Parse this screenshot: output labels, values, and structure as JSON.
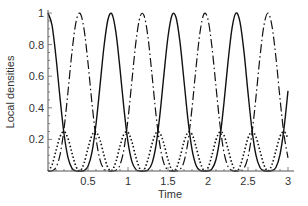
{
  "chart_data": {
    "type": "line",
    "title": "",
    "xlabel": "Time",
    "ylabel": "Local densities",
    "xlim": [
      0,
      3.05
    ],
    "ylim": [
      0,
      1
    ],
    "grid": false,
    "legend": null,
    "x_ticks": [
      0.5,
      1,
      1.5,
      2,
      2.5,
      3
    ],
    "x_tick_labels": [
      "0.5",
      "1",
      "1.5",
      "2",
      "2.5",
      "3"
    ],
    "y_ticks": [
      0.2,
      0.4,
      0.6,
      0.8,
      1
    ],
    "y_tick_labels": [
      "0.2",
      "0.4",
      "0.6",
      "0.8",
      "1"
    ],
    "x": [
      0,
      0.05,
      0.1,
      0.15,
      0.2,
      0.25,
      0.3,
      0.35,
      0.4,
      0.45,
      0.5,
      0.55,
      0.6,
      0.65,
      0.7,
      0.75,
      0.8,
      0.85,
      0.9,
      0.95,
      1.0,
      1.05,
      1.1,
      1.15,
      1.2,
      1.25,
      1.3,
      1.35,
      1.4,
      1.45,
      1.5,
      1.55,
      1.6,
      1.65,
      1.7,
      1.75,
      1.8,
      1.85,
      1.9,
      1.95,
      2.0,
      2.05,
      2.1,
      2.15,
      2.2,
      2.25,
      2.3,
      2.35,
      2.4,
      2.45,
      2.5,
      2.55,
      2.6,
      2.65,
      2.7,
      2.75,
      2.8,
      2.85,
      2.9,
      2.95,
      3.0
    ],
    "series": [
      {
        "name": "solid",
        "style": "solid",
        "values": [
          1.0,
          0.9226,
          0.7198,
          0.464,
          0.2356,
          0.0852,
          0.0172,
          0.0008,
          0.0,
          0.0027,
          0.03,
          0.1199,
          0.2957,
          0.5392,
          0.788,
          0.9606,
          0.9932,
          0.8737,
          0.6467,
          0.3915,
          0.1825,
          0.0578,
          0.0089,
          0.0002,
          0.0001,
          0.0065,
          0.0482,
          0.1623,
          0.3619,
          0.6148,
          0.8499,
          0.9861,
          0.9732,
          0.8152,
          0.5712,
          0.3231,
          0.137,
          0.037,
          0.004,
          0.0,
          0.0004,
          0.0132,
          0.0727,
          0.2122,
          0.4328,
          0.6891,
          0.9029,
          0.9996,
          0.9424,
          0.7536,
          0.4958,
          0.2603,
          0.0989,
          0.0222,
          0.0015,
          0.0,
          0.0018,
          0.024,
          0.1043,
          0.2698,
          0.5071
        ]
      },
      {
        "name": "dash-dot",
        "style": "dashdot",
        "values": [
          0.0,
          0.0016,
          0.023,
          0.1016,
          0.2648,
          0.5014,
          0.7546,
          0.943,
          0.9983,
          0.8995,
          0.6836,
          0.4273,
          0.2081,
          0.0706,
          0.0126,
          0.0004,
          0.0,
          0.0043,
          0.0383,
          0.1401,
          0.3281,
          0.577,
          0.8201,
          0.975,
          0.9847,
          0.8455,
          0.6092,
          0.3565,
          0.1587,
          0.0466,
          0.0061,
          0.0,
          0.0002,
          0.0094,
          0.0596,
          0.1863,
          0.3966,
          0.6524,
          0.8776,
          0.9942,
          0.9581,
          0.7831,
          0.5333,
          0.291,
          0.117,
          0.0289,
          0.0025,
          0.0,
          0.0009,
          0.0174,
          0.0876,
          0.2399,
          0.4699,
          0.7242,
          0.9233,
          1.0,
          0.9168,
          0.7144,
          0.4583,
          0.231,
          0.0829
        ]
      },
      {
        "name": "dotted",
        "style": "dotted",
        "values": [
          0.0,
          0.0379,
          0.1286,
          0.2172,
          0.2498,
          0.2067,
          0.1141,
          0.0281,
          0.0008,
          0.0489,
          0.1432,
          0.2264,
          0.2481,
          0.1951,
          0.0997,
          0.0195,
          0.0034,
          0.061,
          0.1575,
          0.2342,
          0.2447,
          0.1826,
          0.0855,
          0.0124,
          0.0076,
          0.074,
          0.1713,
          0.2406,
          0.2397,
          0.1693,
          0.072,
          0.007,
          0.0133,
          0.0877,
          0.1846,
          0.2453,
          0.2332,
          0.1553,
          0.0592,
          0.0029,
          0.0207,
          0.1018,
          0.197,
          0.2485,
          0.2251,
          0.141,
          0.0473,
          0.0002,
          0.0283,
          0.1145,
          0.2083,
          0.2499,
          0.2156,
          0.1268,
          0.0376,
          0.0,
          0.0407,
          0.1308,
          0.2187,
          0.2496,
          0.205
        ]
      }
    ]
  }
}
